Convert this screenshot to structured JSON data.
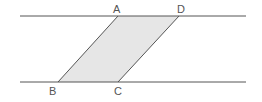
{
  "diagram": {
    "type": "parallelogram-between-parallel-lines",
    "colors": {
      "line": "#555555",
      "fill": "#e6e6e6",
      "label": "#555555"
    },
    "lines": [
      {
        "name": "top-line",
        "x1": 20,
        "y1": 16,
        "x2": 246,
        "y2": 16
      },
      {
        "name": "bottom-line",
        "x1": 20,
        "y1": 82,
        "x2": 246,
        "y2": 82
      }
    ],
    "points": {
      "A": {
        "x": 118,
        "y": 16,
        "label": "A"
      },
      "D": {
        "x": 179,
        "y": 16,
        "label": "D"
      },
      "B": {
        "x": 58,
        "y": 82,
        "label": "B"
      },
      "C": {
        "x": 118,
        "y": 82,
        "label": "C"
      }
    },
    "shape": "ABCD"
  }
}
